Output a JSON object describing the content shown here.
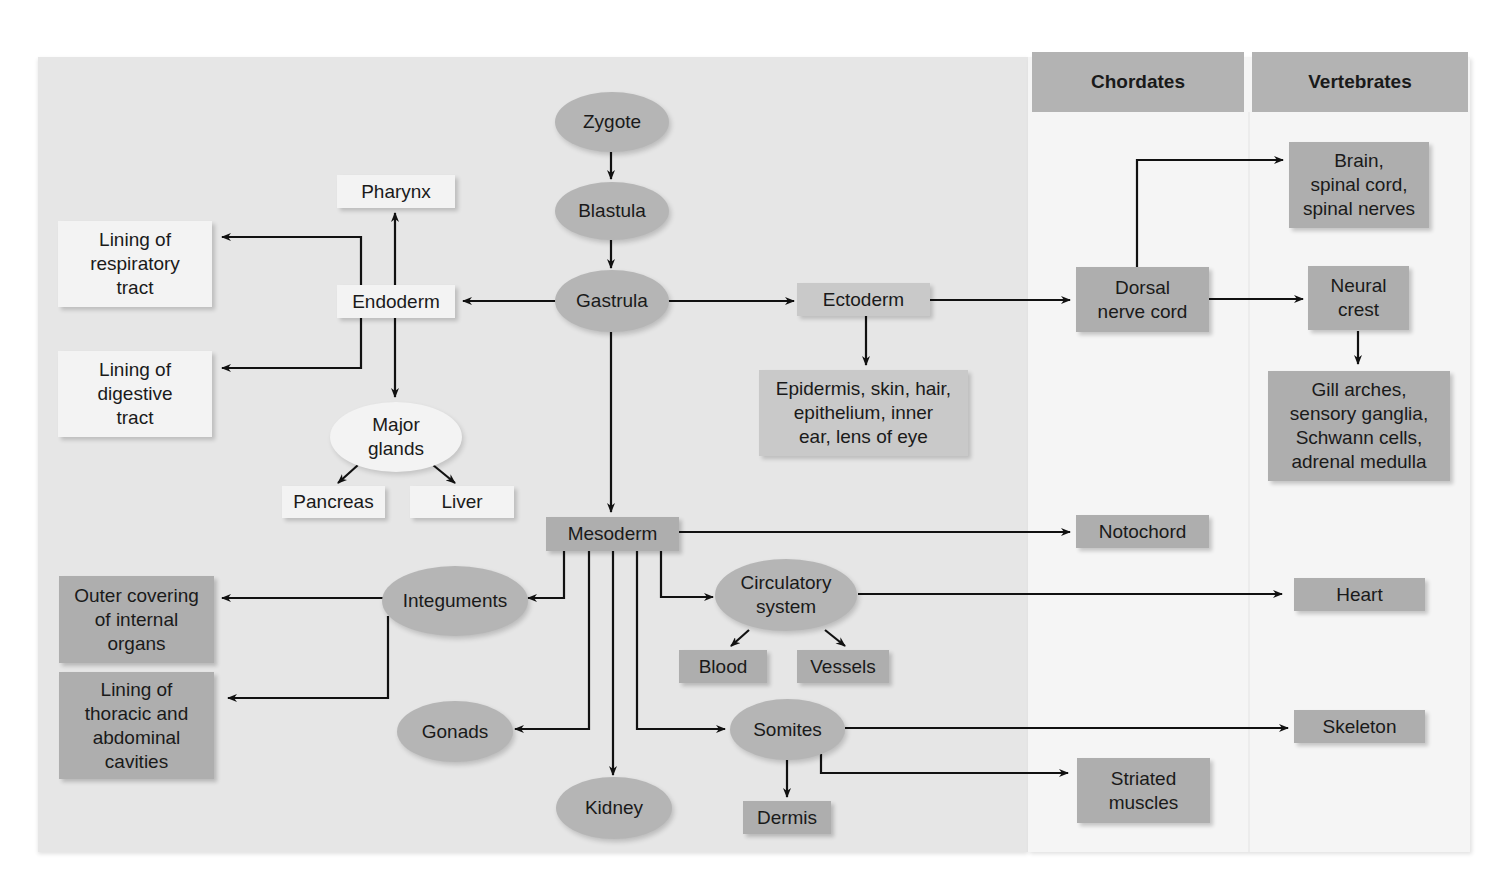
{
  "columns": {
    "chordates": "Chordates",
    "vertebrates": "Vertebrates"
  },
  "nodes": {
    "zygote": "Zygote",
    "blastula": "Blastula",
    "gastrula": "Gastrula",
    "endoderm": "Endoderm",
    "ectoderm": "Ectoderm",
    "mesoderm": "Mesoderm",
    "pharynx": "Pharynx",
    "lining_respiratory": [
      "Lining of",
      "respiratory",
      "tract"
    ],
    "lining_digestive": [
      "Lining of",
      "digestive",
      "tract"
    ],
    "major_glands": [
      "Major",
      "glands"
    ],
    "pancreas": "Pancreas",
    "liver": "Liver",
    "epidermis": [
      "Epidermis, skin, hair,",
      "epithelium, inner",
      "ear, lens of eye"
    ],
    "dorsal_nerve_cord": [
      "Dorsal",
      "nerve cord"
    ],
    "brain": [
      "Brain,",
      "spinal cord,",
      "spinal nerves"
    ],
    "neural_crest": [
      "Neural",
      "crest"
    ],
    "gill_arches": [
      "Gill arches,",
      "sensory ganglia,",
      "Schwann cells,",
      "adrenal medulla"
    ],
    "notochord": "Notochord",
    "integuments": "Integuments",
    "outer_covering": [
      "Outer covering",
      "of internal",
      "organs"
    ],
    "lining_thoracic": [
      "Lining of",
      "thoracic and",
      "abdominal",
      "cavities"
    ],
    "gonads": "Gonads",
    "kidney": "Kidney",
    "circulatory": [
      "Circulatory",
      "system"
    ],
    "blood": "Blood",
    "vessels": "Vessels",
    "heart": "Heart",
    "somites": "Somites",
    "dermis": "Dermis",
    "skeleton": "Skeleton",
    "striated_muscles": [
      "Striated",
      "muscles"
    ]
  },
  "colors": {
    "panel_left": "#e6e6e6",
    "panel_right": "#f5f5f5",
    "header": "#b3b3b3",
    "node_dark": "#aeaeae",
    "node_light": "#f3f3f3",
    "arrow": "#111111"
  }
}
